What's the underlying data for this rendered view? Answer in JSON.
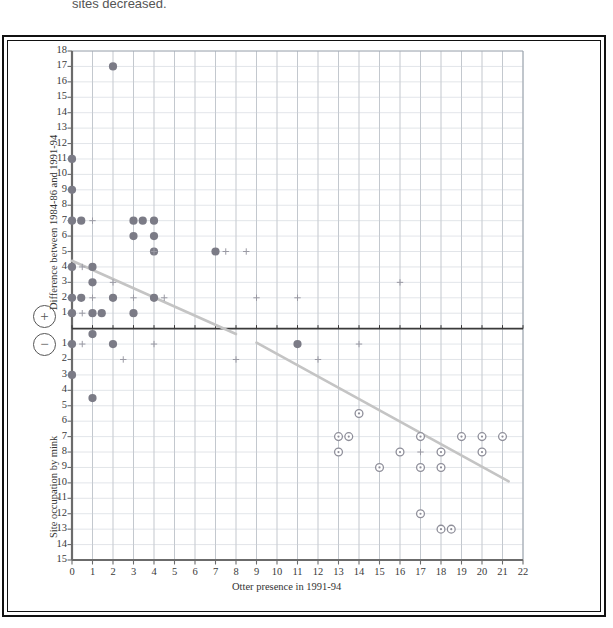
{
  "top_caption": "sites decreased.",
  "axes": {
    "x_title": "Otter presence in 1991-94",
    "y_title_upper": "Difference between 1984-86 and 1991-94",
    "y_title_lower": "Site occupation by mink",
    "x_ticks": [
      "0",
      "1",
      "2",
      "3",
      "4",
      "5",
      "6",
      "7",
      "8",
      "9",
      "10",
      "11",
      "12",
      "13",
      "14",
      "15",
      "16",
      "17",
      "18",
      "19",
      "20",
      "21",
      "22"
    ],
    "y_ticks_upper": [
      "18",
      "17",
      "16",
      "15",
      "14",
      "13",
      "12",
      "11",
      "10",
      "9",
      "8",
      "7",
      "6",
      "5",
      "4",
      "3",
      "2",
      "1"
    ],
    "y_ticks_lower": [
      "1",
      "2",
      "3",
      "4",
      "5",
      "6",
      "7",
      "8",
      "9",
      "10",
      "11",
      "12",
      "13",
      "14",
      "15"
    ],
    "positive_badge": "+",
    "negative_badge": "−"
  },
  "colors": {
    "grid_minor": "#c9cfd6",
    "grid_major": "#9aa3ad",
    "axis": "#6b6b6b",
    "filled_marker": "#7b7b86",
    "open_marker": "#8e8e99",
    "cross_marker": "#9a9aa4",
    "trend_line": "#c4c4c4",
    "frame": "#111111"
  },
  "chart_data": {
    "type": "scatter",
    "title": "",
    "xlabel": "Otter presence in 1991-94",
    "ylabel": "Difference between 1984-86 and 1991-94 / Site occupation by mink",
    "xlim": [
      0,
      22
    ],
    "ylim": [
      -15,
      18
    ],
    "grid": true,
    "legend": "none",
    "note": "y is signed: positive values above the zero line (marked with a circled plus), negative values below (circled minus). Lower-axis tick labels are printed as positive magnitudes.",
    "series": [
      {
        "name": "filled-circle",
        "marker": "filled circle",
        "color": "#7b7b86",
        "points": [
          [
            0,
            11
          ],
          [
            0,
            9
          ],
          [
            0,
            7
          ],
          [
            0.45,
            7
          ],
          [
            0,
            4
          ],
          [
            1,
            4
          ],
          [
            1,
            3
          ],
          [
            0,
            2
          ],
          [
            0.45,
            2
          ],
          [
            2,
            2
          ],
          [
            4,
            2
          ],
          [
            0,
            1
          ],
          [
            1,
            1
          ],
          [
            1.45,
            1
          ],
          [
            3,
            1
          ],
          [
            2,
            17
          ],
          [
            3,
            7
          ],
          [
            3.45,
            7
          ],
          [
            4,
            7
          ],
          [
            3,
            6
          ],
          [
            4,
            6
          ],
          [
            4,
            5
          ],
          [
            7,
            5
          ],
          [
            1,
            -0.35
          ],
          [
            0,
            -1
          ],
          [
            2,
            -1
          ],
          [
            11,
            -1
          ],
          [
            0,
            -3
          ],
          [
            1,
            -4.5
          ]
        ]
      },
      {
        "name": "open-circle",
        "marker": "open circle",
        "color": "#8e8e99",
        "points": [
          [
            14,
            -5.5
          ],
          [
            13,
            -7
          ],
          [
            13.5,
            -7
          ],
          [
            17,
            -7
          ],
          [
            19,
            -7
          ],
          [
            20,
            -7
          ],
          [
            21,
            -7
          ],
          [
            13,
            -8
          ],
          [
            16,
            -8
          ],
          [
            18,
            -8
          ],
          [
            20,
            -8
          ],
          [
            15,
            -9
          ],
          [
            17,
            -9
          ],
          [
            18,
            -9
          ],
          [
            17,
            -12
          ],
          [
            18,
            -13
          ],
          [
            18.5,
            -13
          ]
        ]
      },
      {
        "name": "small-cross",
        "marker": "plus / cross",
        "color": "#9a9aa4",
        "points": [
          [
            1,
            7
          ],
          [
            0.5,
            4
          ],
          [
            2,
            3
          ],
          [
            1,
            2
          ],
          [
            3,
            2
          ],
          [
            4.5,
            2
          ],
          [
            9,
            2
          ],
          [
            11,
            2
          ],
          [
            0.5,
            1
          ],
          [
            4,
            5
          ],
          [
            7.5,
            5
          ],
          [
            8.5,
            5
          ],
          [
            16,
            3
          ],
          [
            0.5,
            -1
          ],
          [
            4,
            -1
          ],
          [
            14,
            -1
          ],
          [
            2.5,
            -2
          ],
          [
            8,
            -2
          ],
          [
            12,
            -2
          ],
          [
            17,
            -8
          ]
        ]
      }
    ],
    "trend_lines": [
      {
        "name": "upper-segment",
        "x0": 0.0,
        "y0": 4.4,
        "x1": 8.0,
        "y1": -0.35
      },
      {
        "name": "lower-segment",
        "x0": 9.0,
        "y0": -0.9,
        "x1": 21.3,
        "y1": -9.9
      }
    ]
  }
}
